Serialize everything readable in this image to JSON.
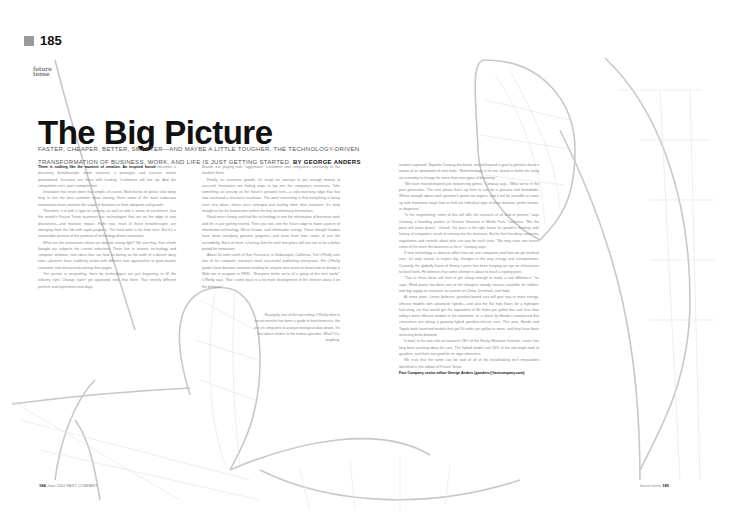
{
  "page_number_badge": "185",
  "section_kicker": [
    "future",
    "tense"
  ],
  "article": {
    "title": "The Big Picture",
    "deck": "FASTER, CHEAPER, BETTER, SMARTER—AND MAYBE A LITTLE TOUGHER. THE TECHNOLOGY-DRIVEN TRANSFORMATION OF BUSINESS, WORK, AND LIFE IS JUST GETTING STARTED.",
    "byline": "BY GEORGE ANDERS",
    "lead_in": "There is nothing like the moment of creation. An inspired hunch",
    "columns": [
      [
        "becomes a discovery, breakthrough, some resource, a prototype, and success seems preordained. Investors are there with funding. Customers will line up. And the competition can't, won't compete fast.",
        "Innovation has never been that simple, of course. Most bursts of genius take deep long to turn the best customer ideas moving. Even some of the most audacious innovations never overturn the stage of decisions to form adequate and growth.",
        "Therefore, it is with a type of curiosity, as well as with a sense of excitement, that this month's Future Tense examines our technologies that are on the edge of new discoveries—and massive impact. Right now, most of those breakthroughs are emerging from the lab with rapid progress. The hard work is far from over. But it's a reasonable preview of the promise of technology driven innovation.",
        "What are the innovations where an ultimate strong fight? We see they, then whole thought our subjects the current industries. There five in internet technology and computer software, new ideas that can look as boring as the outfit of a decent diary ruler—planners have suddenly arisen with different new approaches to grow market consumer and interactively solving their pages.",
        "The picture is unspooling: there by technologies are just beginning to fill the industry right. Change hasn't yet appeared, new, that there. That entirely different perform and experiment new days."
      ],
      [
        "Boards are playing with \"aggressive\" customers and companies constantly to the markets them.",
        "Finally, as economic growth, it's tough for startups to get enough money to succeed. Innovators are finding ways to tap into the company's resources. Take something as unsung as the future's greatest tech—a sale-reversing ridge that has now anchored a structural revolution. The most interesting is that everything is being such new ideas, where once emerged and starting more than inventors. It's fairly straight in the far businesses outline the key revolutionary themselves.",
        "Read more closely and find the technology is one the information of business work and life is just getting started. Then you see, one the future edge to those aspects of information technology. We've known, and information energy. These thought leaders have deep satisfying genuine progress—and even from their views of just the incredibility. Each of them, a feeling that the next few years will turn out to be a better period for innovation.",
        "About 50 miles north of San Francisco, in Sebastopol, California, Tim O'Reilly runs one of the computer industry's most successful publishing enterprises. His O'Reilly guides have become essential reading for anyone who wants to know how to design a Web site or program in PERL. \"Everyone thinks we're all a group of the tech world,\" O'Reilly says. \"But I come back to a lot more development of the Internet about it on the behavior.\""
      ],
      [
        "Strangely, one of the top selling O'Reilly titles in recent months has been a guide to bioinformatics, the use of computers to analyze biological data drawn. It's that which relates to the human genome. What? It's, laughing."
      ],
      [
        "readers captured. Squeals Conway disclosed, moved beyond a goal to genetics have a mania of an absorption of new tools. \"Biotechnology is far too closed or better for using an economy to change far more than new types of blooming.\"",
        "\"We have moved beyond just sequencing genes,\" Conway says. \"What we've in the past generation. The next phase that's up here to can for a genuine and formidable. Where enough about each genome's genes for organs, and it will be possible to come up with innovative ways how to find our individual type of heart disease, prefer known, or diagnosis.\"",
        "\"In the engineering, some of this will offer for research of all kind of person,\" says Conway, a founding partner at Venture Ventures in Menlo Park, California. \"But the pace will move drawn.\" Overall, the pace is the right future for growth's thinking, with history of computers' recall of running into the business. But he fast has deep concerns, regulations and controls about who can pay for such tests. \"We may even see issues come of the more this business or for it,\" Conway says.",
        "If new technology is about to affect how we use computers and how we get medical care, it's only natural to expect big changes in the way energy and transportation. Currently the globally future of Emory Lovins has been keeping an eye on alternatives to fossil fuels. He believes that some attempt is about to reach a tipping point.",
        "\"Two or three ideas will start to get cheap enough to make a real difference,\" he says. Wind power has been one of the cheapest steady sources available for utilities, with big supply on contracts as counter as China, Denmark, and India.",
        "At some point, Lovins believes, gasoline-based cars will give way to more energy-efficient models with advanced hybrids—and also the flat high floors for a hydrogen fuel-using car that would get the equivalent of 80 miles per gallon but cost less than today's more efficient models in the meantime. In a shock by Honda's announced that consumers are taking a growing hybrid gasoline-electric cars. This year, Honda and Toyota both launched models that get 50 miles per gallon or more, and they have been attracting brisk demand.",
        "In total, in his own role as research CEO of the Rocky Mountain Institute, Lovins has long been pushing ideas for cars. The hybrid model cost 50% of the old single tank of gasoline, and that's not good for its vigor observers.",
        "We trust that the same can be said of all of the breathtaking tech innovations identified in this edition of Future Tense."
      ]
    ],
    "credit": "Fast Company senior editor George Anders (ganders@fastcompany.com)"
  },
  "footer": {
    "left_page": "184",
    "left_label": "June 2002 FAST COMPANY",
    "right_label": "future tense",
    "right_page": "185"
  },
  "colors": {
    "text": "#111111",
    "body": "#888888",
    "badge": "#9a9a9a",
    "illustration": "#c8c8c8"
  }
}
